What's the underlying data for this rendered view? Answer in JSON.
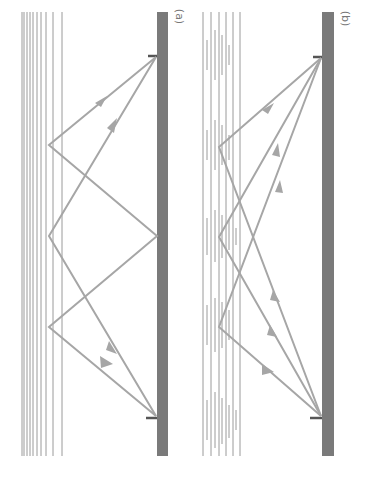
{
  "figure": {
    "panels": [
      {
        "id": "a",
        "label": "(a)",
        "description": "Homogeneous layered medium: multiple reflections between layer and mirror"
      },
      {
        "id": "b",
        "label": "(b)",
        "description": "Inhomogeneous layered medium: scattering from several depth points"
      }
    ]
  },
  "colors": {
    "ray": "#a6a6a6",
    "layer_line": "#9a9a9a",
    "mirror": "#7a7a7a",
    "label": "#777777"
  }
}
